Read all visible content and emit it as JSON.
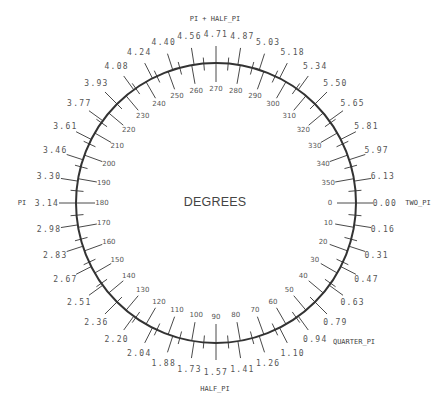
{
  "dial": {
    "title": "DEGREES",
    "colors": {
      "ring": "#333333",
      "ticks": "#4a4a4a",
      "text": "#555555"
    },
    "degree_step": 10,
    "radian_step_degrees": 9,
    "degree_labels": [
      "0",
      "10",
      "20",
      "30",
      "40",
      "50",
      "60",
      "70",
      "80",
      "90",
      "100",
      "110",
      "120",
      "130",
      "140",
      "150",
      "160",
      "170",
      "180",
      "190",
      "200",
      "210",
      "220",
      "230",
      "240",
      "250",
      "260",
      "270",
      "280",
      "290",
      "300",
      "310",
      "320",
      "330",
      "340",
      "350"
    ],
    "radian_labels": [
      "0.00",
      "0.16",
      "0.31",
      "0.47",
      "0.63",
      "0.79",
      "0.94",
      "1.10",
      "1.26",
      "1.41",
      "1.57",
      "1.73",
      "1.88",
      "2.04",
      "2.20",
      "2.36",
      "2.51",
      "2.67",
      "2.83",
      "2.98",
      "3.14",
      "3.30",
      "3.46",
      "3.61",
      "3.77",
      "3.93",
      "4.08",
      "4.24",
      "4.40",
      "4.56",
      "4.71",
      "4.87",
      "5.03",
      "5.18",
      "5.34",
      "5.50",
      "5.65",
      "5.81",
      "5.97",
      "6.13"
    ],
    "named_labels": {
      "two_pi": "TWO_PI",
      "quarter_pi": "QUARTER_PI",
      "half_pi": "HALF_PI",
      "pi": "PI",
      "pi_plus_half_pi": "PI + HALF_PI"
    }
  }
}
